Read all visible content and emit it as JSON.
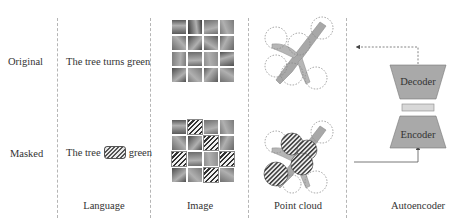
{
  "rows": {
    "original": "Original",
    "masked": "Masked"
  },
  "columns": {
    "language": "Language",
    "image": "Image",
    "point_cloud": "Point cloud",
    "autoencoder": "Autoencoder"
  },
  "language": {
    "original_sentence": "The tree turns green",
    "masked_prefix": "The tree",
    "masked_token": "[masked: turns]",
    "masked_suffix": "green"
  },
  "image": {
    "grid_size": 4,
    "masked_cells": [
      [
        0,
        1
      ],
      [
        1,
        2
      ],
      [
        2,
        0
      ],
      [
        2,
        3
      ],
      [
        3,
        2
      ]
    ],
    "cell_shades": [
      [
        "#5a5a5a",
        "#3a3a3a",
        "#6e6e6e",
        "#7a7a7a"
      ],
      [
        "#6a6a6a",
        "#4a4a4a",
        "#5e5e5e",
        "#666666"
      ],
      [
        "#7c7c7c",
        "#6a6a6a",
        "#8c8c8c",
        "#4e4e4e"
      ],
      [
        "#4c4c4c",
        "#787878",
        "#5a5a5a",
        "#707070"
      ]
    ]
  },
  "point_cloud": {
    "patches": 6,
    "masked_patches": 4
  },
  "autoencoder": {
    "decoder_label": "Decoder",
    "encoder_label": "Encoder",
    "fill_color": "#a9a9a9",
    "latent_color": "#d8d8d8"
  }
}
